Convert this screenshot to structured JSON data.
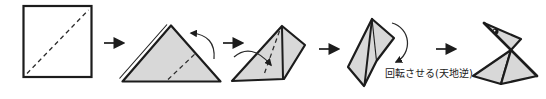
{
  "caption": {
    "rotate_label": "回転させる(天地逆)"
  },
  "colors": {
    "paper": "#d8d8d8",
    "paper_white": "#ffffff",
    "line": "#1c1c1c"
  }
}
